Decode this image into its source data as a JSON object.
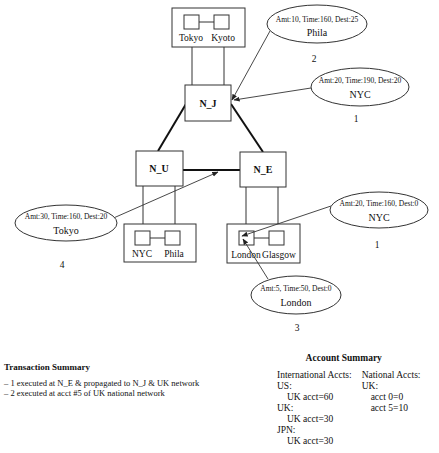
{
  "diagram": {
    "backbone_nodes": [
      {
        "id": "N_J",
        "label": "N_J"
      },
      {
        "id": "N_U",
        "label": "N_U"
      },
      {
        "id": "N_E",
        "label": "N_E"
      }
    ],
    "national_networks": [
      {
        "attached_to": "N_J",
        "cities": [
          "Tokyo",
          "Kyoto"
        ]
      },
      {
        "attached_to": "N_U",
        "cities": [
          "NYC",
          "Phila"
        ]
      },
      {
        "attached_to": "N_E",
        "cities": [
          "London",
          "Glasgow"
        ]
      }
    ],
    "transactions": [
      {
        "details": "Amt:10, Time:160, Dest:25",
        "city": "Phila",
        "number": "2",
        "target": "N_J"
      },
      {
        "details": "Amt:20, Time:190, Dest:20",
        "city": "NYC",
        "number": "1",
        "target": "N_J"
      },
      {
        "details": "Amt:20, Time:160, Dest:0",
        "city": "NYC",
        "number": "1",
        "target": "London"
      },
      {
        "details": "Amt:30, Time:160, Dest:20",
        "city": "Tokyo",
        "number": "4",
        "target": "N_U-N_E link"
      },
      {
        "details": "Amt:5, Time:50, Dest:0",
        "city": "London",
        "number": "3",
        "target": "London"
      }
    ]
  },
  "transaction_summary": {
    "title": "Transaction Summary",
    "items": [
      "– 1 executed at N_E & propagated to N_J & UK network",
      "– 2 executed at acct #5 of UK national network"
    ]
  },
  "account_summary": {
    "title": "Account Summary",
    "international": {
      "heading": "International Accts:",
      "groups": [
        {
          "country": "US:",
          "entry": "UK acct=60"
        },
        {
          "country": "UK:",
          "entry": "UK acct=30"
        },
        {
          "country": "JPN:",
          "entry": "UK acct=30"
        }
      ]
    },
    "national": {
      "heading": "National Accts:",
      "country": "UK:",
      "entries": [
        "acct 0=0",
        "acct 5=10"
      ]
    }
  }
}
